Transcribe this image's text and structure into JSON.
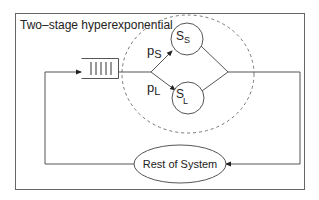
{
  "diagram": {
    "title": "Two–stage hyperexponential",
    "branches": {
      "upper": {
        "prob_main": "p",
        "prob_sub": "S",
        "server_main": "S",
        "server_sub": "S"
      },
      "lower": {
        "prob_main": "p",
        "prob_sub": "L",
        "server_main": "S",
        "server_sub": "L"
      }
    },
    "rest_of_system": "Rest of System",
    "queue": {
      "slots": 5
    },
    "colors": {
      "stroke": "#555555",
      "dashed": "#777777",
      "text": "#222222"
    }
  }
}
